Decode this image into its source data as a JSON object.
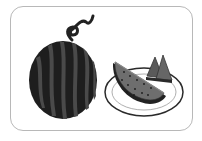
{
  "illustration": {
    "subject": "watermelons",
    "items": [
      {
        "name": "whole-watermelon",
        "label": "whole watermelon with curly stem"
      },
      {
        "name": "watermelon-slices-plate",
        "label": "watermelon slices on a plate"
      }
    ],
    "colors": {
      "frame_border": "#b8b8b8",
      "rind_dark": "#1e1e1e",
      "rind_stripe": "#4a4a4a",
      "flesh": "#6e6e6e",
      "plate": "#ffffff",
      "plate_outline": "#2a2a2a"
    }
  }
}
